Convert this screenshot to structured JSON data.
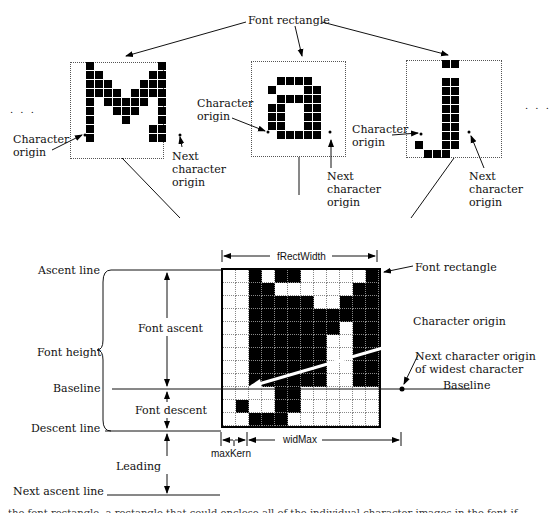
{
  "top": {
    "font_rectangle_label": "Font rectangle",
    "ellipsis_left": ". . .",
    "ellipsis_right": ". . .",
    "char_M": {
      "char": "M",
      "origin_label": "Character origin",
      "next_label": "Next character origin"
    },
    "char_a": {
      "char": "a",
      "origin_label": "Character origin",
      "next_label": "Next character origin"
    },
    "char_j": {
      "char": "j",
      "origin_label": "Character origin",
      "next_label": "Next character origin"
    }
  },
  "bottom": {
    "left_labels": {
      "ascent_line": "Ascent line",
      "font_height": "Font height",
      "baseline": "Baseline",
      "descent_line": "Descent line",
      "next_ascent_line": "Next ascent line"
    },
    "measure_labels": {
      "font_ascent": "Font ascent",
      "font_descent": "Font descent",
      "leading": "Leading",
      "frect_width": "fRectWidth",
      "wid_max": "widMax",
      "max_kern": "maxKern"
    },
    "right_labels": {
      "font_rectangle": "Font rectangle",
      "character_origin": "Character origin",
      "next_origin_widest": "Next character origin of widest character",
      "baseline": "Baseline"
    },
    "grid": [
      [
        0,
        0,
        1,
        0,
        1,
        1,
        0,
        0,
        0,
        0,
        0,
        1
      ],
      [
        0,
        0,
        1,
        1,
        0,
        0,
        0,
        0,
        0,
        0,
        1,
        1
      ],
      [
        0,
        0,
        1,
        1,
        1,
        1,
        1,
        0,
        0,
        1,
        1,
        1
      ],
      [
        0,
        0,
        1,
        1,
        1,
        1,
        1,
        1,
        1,
        1,
        1,
        1
      ],
      [
        0,
        0,
        1,
        1,
        1,
        1,
        1,
        1,
        1,
        0,
        1,
        1
      ],
      [
        0,
        0,
        1,
        1,
        1,
        1,
        1,
        1,
        0,
        0,
        1,
        1
      ],
      [
        0,
        0,
        1,
        1,
        1,
        1,
        1,
        1,
        0,
        0,
        1,
        1
      ],
      [
        0,
        0,
        1,
        1,
        1,
        1,
        1,
        1,
        0,
        0,
        1,
        1
      ],
      [
        0,
        0,
        1,
        1,
        1,
        1,
        1,
        1,
        0,
        0,
        1,
        1
      ],
      [
        0,
        0,
        0,
        0,
        1,
        1,
        0,
        0,
        0,
        0,
        0,
        0
      ],
      [
        0,
        1,
        0,
        0,
        1,
        1,
        0,
        0,
        0,
        0,
        0,
        0
      ],
      [
        0,
        0,
        1,
        1,
        1,
        0,
        0,
        0,
        0,
        0,
        0,
        0
      ]
    ]
  },
  "glyphs": {
    "M": [
      [
        1,
        0,
        0,
        0,
        0,
        0,
        0,
        0,
        1
      ],
      [
        1,
        1,
        0,
        0,
        0,
        0,
        0,
        1,
        1
      ],
      [
        1,
        1,
        1,
        0,
        0,
        0,
        1,
        1,
        1
      ],
      [
        1,
        1,
        1,
        1,
        0,
        1,
        1,
        1,
        1
      ],
      [
        1,
        0,
        1,
        1,
        1,
        1,
        1,
        0,
        1
      ],
      [
        1,
        0,
        0,
        1,
        1,
        1,
        0,
        0,
        1
      ],
      [
        1,
        0,
        0,
        0,
        1,
        0,
        0,
        0,
        1
      ],
      [
        1,
        0,
        0,
        0,
        0,
        0,
        0,
        1,
        1
      ],
      [
        1,
        0,
        0,
        0,
        0,
        0,
        0,
        1,
        1
      ]
    ],
    "a": [
      [
        0,
        1,
        1,
        1,
        1,
        0
      ],
      [
        1,
        0,
        0,
        0,
        1,
        1
      ],
      [
        0,
        1,
        1,
        1,
        1,
        1
      ],
      [
        1,
        1,
        0,
        0,
        1,
        1
      ],
      [
        1,
        1,
        0,
        0,
        1,
        1
      ],
      [
        1,
        1,
        0,
        0,
        1,
        1
      ],
      [
        0,
        1,
        1,
        1,
        1,
        1
      ]
    ],
    "j": [
      [
        0,
        0,
        0,
        1,
        1
      ],
      [
        0,
        0,
        0,
        0,
        0
      ],
      [
        0,
        0,
        0,
        1,
        1
      ],
      [
        0,
        0,
        0,
        1,
        1
      ],
      [
        0,
        0,
        0,
        1,
        1
      ],
      [
        0,
        0,
        0,
        1,
        1
      ],
      [
        0,
        0,
        0,
        1,
        1
      ],
      [
        0,
        0,
        0,
        1,
        1
      ],
      [
        0,
        0,
        0,
        1,
        1
      ],
      [
        1,
        0,
        0,
        1,
        1
      ],
      [
        0,
        1,
        1,
        1,
        0
      ]
    ]
  },
  "caption": "the font rectangle, a rectangle that could enclose all of the individual character images in the font if those images were superimposed"
}
